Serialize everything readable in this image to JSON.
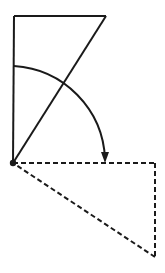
{
  "figure": {
    "canvas": {
      "width": 165,
      "height": 273,
      "background": "#ffffff"
    },
    "stroke_color": "#1a1a1a",
    "stroke_width": 2,
    "dash_pattern": "5,3",
    "vertex": {
      "name": "origin-vertex",
      "x": 13,
      "y": 163,
      "radius": 3.2
    },
    "solid_shape": {
      "name": "solid-triangle",
      "points": [
        {
          "label": "top-left",
          "x": 14,
          "y": 16
        },
        {
          "label": "top-right",
          "x": 106,
          "y": 16
        },
        {
          "label": "origin",
          "x": 13,
          "y": 163
        }
      ],
      "edges": [
        {
          "name": "top-edge",
          "from": "top-left",
          "to": "top-right"
        },
        {
          "name": "left-vertical-edge",
          "from": "top-left",
          "to": "origin"
        },
        {
          "name": "hypotenuse-edge",
          "from": "top-right",
          "to": "origin"
        }
      ]
    },
    "dashed_shape": {
      "name": "dashed-triangle",
      "points": [
        {
          "label": "origin",
          "x": 13,
          "y": 163
        },
        {
          "label": "right-corner",
          "x": 155,
          "y": 163
        },
        {
          "label": "bottom-corner",
          "x": 155,
          "y": 257
        }
      ],
      "edges": [
        {
          "name": "horizontal-dashed-edge",
          "from": "origin",
          "to": "right-corner"
        },
        {
          "name": "vertical-dashed-edge",
          "from": "right-corner",
          "to": "bottom-corner"
        },
        {
          "name": "diagonal-dashed-edge",
          "from": "bottom-corner",
          "to": "origin"
        }
      ]
    },
    "rotation_arc": {
      "name": "rotation-arc",
      "center": {
        "x": 13,
        "y": 163
      },
      "radius": 97,
      "start_point": {
        "x": 14,
        "y": 66
      },
      "end_point": {
        "x": 105,
        "y": 159
      },
      "sweep_direction": "clockwise",
      "arrowhead": {
        "name": "arc-arrowhead",
        "tip": {
          "x": 105,
          "y": 163
        },
        "direction": "down",
        "width": 8,
        "length": 11
      }
    }
  }
}
